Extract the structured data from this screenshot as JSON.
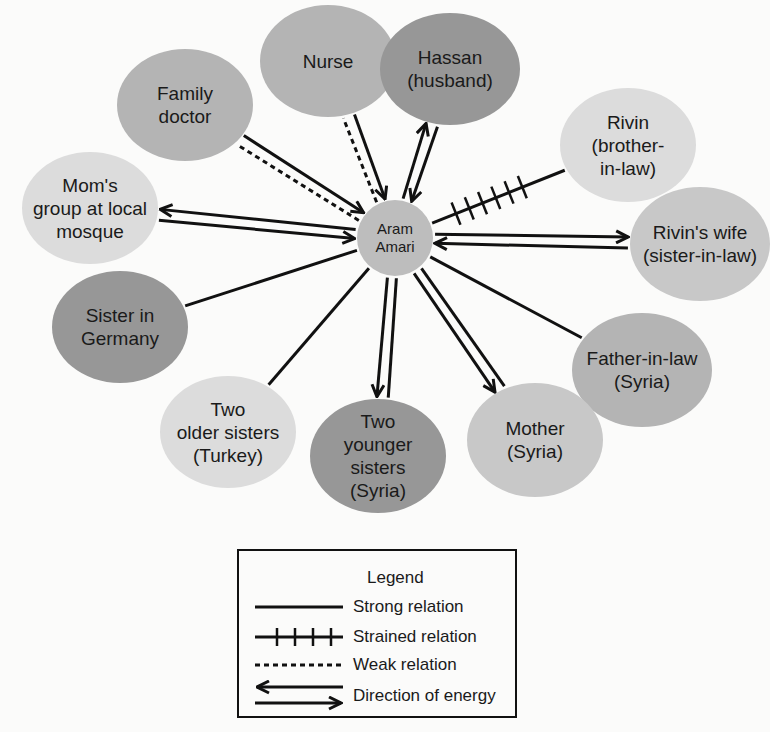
{
  "diagram": {
    "type": "ecomap",
    "center": {
      "label": "Aram\nAmari",
      "x": 395,
      "y": 238,
      "r": 38,
      "fill": "#bdbdbd"
    },
    "nodes": [
      {
        "id": "nurse",
        "label": "Nurse",
        "x": 328,
        "y": 61,
        "rx": 68,
        "ry": 56,
        "fill": "#b4b4b4"
      },
      {
        "id": "family-doctor",
        "label": "Family\ndoctor",
        "x": 185,
        "y": 105,
        "rx": 68,
        "ry": 56,
        "fill": "#b4b4b4"
      },
      {
        "id": "hassan",
        "label": "Hassan\n(husband)",
        "x": 450,
        "y": 69,
        "rx": 70,
        "ry": 56,
        "fill": "#979797"
      },
      {
        "id": "rivin",
        "label": "Rivin\n(brother-\nin-law)",
        "x": 628,
        "y": 145,
        "rx": 68,
        "ry": 57,
        "fill": "#dcdcdc"
      },
      {
        "id": "moms-group",
        "label": "Mom's\ngroup at local\nmosque",
        "x": 90,
        "y": 208,
        "rx": 68,
        "ry": 56,
        "fill": "#dcdcdc"
      },
      {
        "id": "rivins-wife",
        "label": "Rivin's wife\n(sister-in-law)",
        "x": 700,
        "y": 244,
        "rx": 70,
        "ry": 57,
        "fill": "#c8c8c8"
      },
      {
        "id": "sister-germany",
        "label": "Sister in\nGermany",
        "x": 120,
        "y": 327,
        "rx": 68,
        "ry": 56,
        "fill": "#979797"
      },
      {
        "id": "father-in-law",
        "label": "Father-in-law\n(Syria)",
        "x": 642,
        "y": 370,
        "rx": 70,
        "ry": 57,
        "fill": "#b4b4b4"
      },
      {
        "id": "older-sisters",
        "label": "Two\nolder sisters\n(Turkey)",
        "x": 228,
        "y": 432,
        "rx": 68,
        "ry": 56,
        "fill": "#dcdcdc"
      },
      {
        "id": "younger-sisters",
        "label": "Two\nyounger\nsisters\n(Syria)",
        "x": 378,
        "y": 456,
        "rx": 68,
        "ry": 57,
        "fill": "#979797"
      },
      {
        "id": "mother",
        "label": "Mother\n(Syria)",
        "x": 535,
        "y": 440,
        "rx": 68,
        "ry": 57,
        "fill": "#c8c8c8"
      }
    ],
    "connections": [
      {
        "to": "nurse",
        "relation": "weak",
        "energy": "none"
      },
      {
        "to": "nurse",
        "relation": "strong",
        "energy": "to-center"
      },
      {
        "to": "family-doctor",
        "relation": "weak",
        "energy": "none"
      },
      {
        "to": "family-doctor",
        "relation": "strong",
        "energy": "to-center"
      },
      {
        "to": "hassan",
        "relation": "strong",
        "energy": "to-node"
      },
      {
        "to": "hassan",
        "relation": "strong",
        "energy": "to-center"
      },
      {
        "to": "rivin",
        "relation": "strained",
        "energy": "none"
      },
      {
        "to": "moms-group",
        "relation": "strong",
        "energy": "to-center"
      },
      {
        "to": "moms-group",
        "relation": "strong",
        "energy": "to-node"
      },
      {
        "to": "rivins-wife",
        "relation": "strong",
        "energy": "to-node"
      },
      {
        "to": "rivins-wife",
        "relation": "strong",
        "energy": "to-center"
      },
      {
        "to": "sister-germany",
        "relation": "strong",
        "energy": "none"
      },
      {
        "to": "father-in-law",
        "relation": "strong",
        "energy": "none"
      },
      {
        "to": "older-sisters",
        "relation": "strong",
        "energy": "none"
      },
      {
        "to": "younger-sisters",
        "relation": "strong",
        "energy": "none"
      },
      {
        "to": "younger-sisters",
        "relation": "strong",
        "energy": "to-node"
      },
      {
        "to": "mother",
        "relation": "strong",
        "energy": "none"
      },
      {
        "to": "mother",
        "relation": "strong",
        "energy": "to-node"
      }
    ]
  },
  "legend": {
    "title": "Legend",
    "items": [
      {
        "symbol": "strong",
        "label": "Strong relation"
      },
      {
        "symbol": "strained",
        "label": "Strained relation"
      },
      {
        "symbol": "weak",
        "label": "Weak relation"
      },
      {
        "symbol": "energy",
        "label": "Direction of energy"
      }
    ]
  },
  "colors": {
    "background": "#fbfbfa",
    "line": "#111111",
    "text": "#1a1a1a"
  }
}
